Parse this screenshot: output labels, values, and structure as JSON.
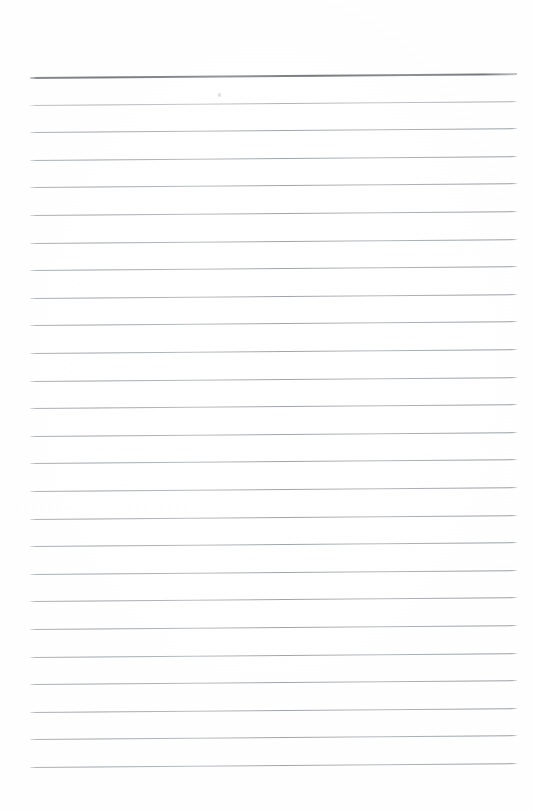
{
  "document": {
    "kind": "scanned-page",
    "title": "Blank ruled notebook page",
    "text_content": "",
    "page_width_px": 533,
    "page_height_px": 811,
    "background_color": "#ffffff",
    "paper_tone": "#fdfdfd",
    "has_handwriting": false,
    "has_printed_text": false,
    "orientation": "portrait"
  },
  "ruling": {
    "line_count": 26,
    "first_line_y": 77,
    "last_line_y": 767,
    "line_spacing_px": 27.6,
    "line_start_x": 30,
    "line_end_x": 517,
    "line_length_px": 487,
    "skew_degrees": -0.46,
    "standard_line_color": "#a0a5ab",
    "header_line_color": "#787c81",
    "header_line_index": 0,
    "header_line_thickness_px": 2,
    "standard_line_thickness_px": 1,
    "left_margin_px": 30,
    "right_margin_px": 16,
    "top_margin_px": 77,
    "bottom_margin_px": 44,
    "lines": [
      {
        "index": 0,
        "y": 77,
        "weight": "heavy"
      },
      {
        "index": 1,
        "y": 105,
        "weight": "light"
      },
      {
        "index": 2,
        "y": 132,
        "weight": "normal"
      },
      {
        "index": 3,
        "y": 160,
        "weight": "normal"
      },
      {
        "index": 4,
        "y": 187,
        "weight": "normal"
      },
      {
        "index": 5,
        "y": 215,
        "weight": "normal"
      },
      {
        "index": 6,
        "y": 243,
        "weight": "normal"
      },
      {
        "index": 7,
        "y": 270,
        "weight": "normal"
      },
      {
        "index": 8,
        "y": 298,
        "weight": "normal"
      },
      {
        "index": 9,
        "y": 325,
        "weight": "normal"
      },
      {
        "index": 10,
        "y": 353,
        "weight": "normal"
      },
      {
        "index": 11,
        "y": 381,
        "weight": "normal"
      },
      {
        "index": 12,
        "y": 408,
        "weight": "normal"
      },
      {
        "index": 13,
        "y": 436,
        "weight": "normal"
      },
      {
        "index": 14,
        "y": 463,
        "weight": "normal"
      },
      {
        "index": 15,
        "y": 491,
        "weight": "normal"
      },
      {
        "index": 16,
        "y": 519,
        "weight": "normal"
      },
      {
        "index": 17,
        "y": 546,
        "weight": "normal"
      },
      {
        "index": 18,
        "y": 574,
        "weight": "normal"
      },
      {
        "index": 19,
        "y": 601,
        "weight": "normal"
      },
      {
        "index": 20,
        "y": 629,
        "weight": "normal"
      },
      {
        "index": 21,
        "y": 657,
        "weight": "normal"
      },
      {
        "index": 22,
        "y": 684,
        "weight": "normal"
      },
      {
        "index": 23,
        "y": 712,
        "weight": "normal"
      },
      {
        "index": 24,
        "y": 739,
        "weight": "normal"
      },
      {
        "index": 25,
        "y": 767,
        "weight": "normal"
      }
    ]
  },
  "artifacts": {
    "specks": [
      {
        "x": 218,
        "y": 93
      }
    ]
  }
}
